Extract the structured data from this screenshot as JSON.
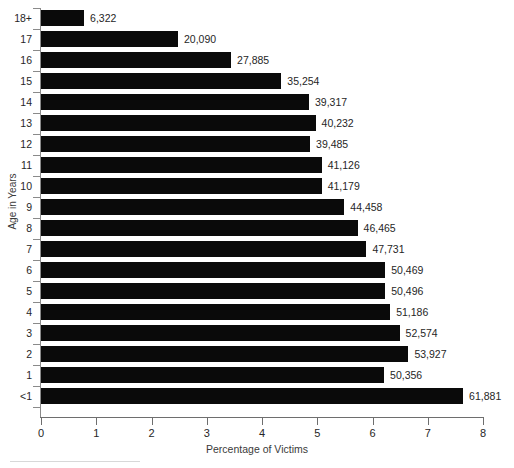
{
  "chart_data": {
    "type": "bar",
    "orientation": "horizontal",
    "title": "",
    "xlabel": "Percentage of Victims",
    "ylabel": "Age in Years",
    "xlim": [
      0,
      8
    ],
    "xticks": [
      "0",
      "1",
      "2",
      "3",
      "4",
      "5",
      "6",
      "7",
      "8"
    ],
    "grid": false,
    "legend": false,
    "bar_color": "#0a0a0a",
    "categories": [
      "18+",
      "17",
      "16",
      "15",
      "14",
      "13",
      "12",
      "11",
      "10",
      "9",
      "8",
      "7",
      "6",
      "5",
      "4",
      "3",
      "2",
      "1",
      "<1"
    ],
    "values": [
      0.78,
      2.48,
      3.44,
      4.35,
      4.85,
      4.97,
      4.87,
      5.08,
      5.08,
      5.49,
      5.73,
      5.89,
      6.23,
      6.23,
      6.32,
      6.49,
      6.65,
      6.21,
      7.64
    ],
    "data_labels": [
      "6,322",
      "20,090",
      "27,885",
      "35,254",
      "39,317",
      "40,232",
      "39,485",
      "41,126",
      "41,179",
      "44,458",
      "46,465",
      "47,731",
      "50,469",
      "50,496",
      "51,186",
      "52,574",
      "53,927",
      "50,356",
      "61,881"
    ],
    "counts": [
      6322,
      20090,
      27885,
      35254,
      39317,
      40232,
      39485,
      41126,
      41179,
      44458,
      46465,
      47731,
      50469,
      50496,
      51186,
      52574,
      53927,
      50356,
      61881
    ]
  }
}
